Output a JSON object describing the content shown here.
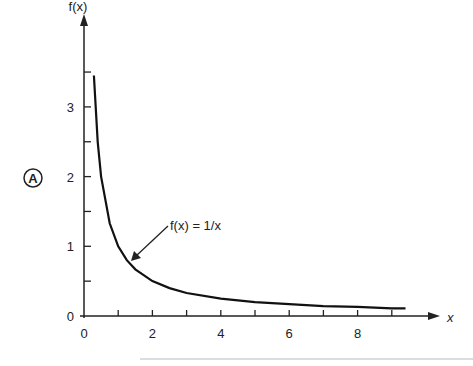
{
  "figure": {
    "panel_label": "A"
  },
  "chart_data": {
    "type": "line",
    "title": "",
    "xlabel": "x",
    "ylabel": "f(x)",
    "annotation": "f(x) = 1/x",
    "xlim": [
      0,
      9.5
    ],
    "ylim": [
      0,
      3.5
    ],
    "x_ticks": [
      0,
      2,
      4,
      6,
      8
    ],
    "y_ticks": [
      0,
      1,
      2,
      3
    ],
    "grid": false,
    "series": [
      {
        "name": "f(x) = 1/x",
        "x": [
          0.29,
          0.4,
          0.5,
          0.75,
          1,
          1.25,
          1.5,
          2,
          2.5,
          3,
          4,
          5,
          6,
          7,
          8,
          9,
          9.4
        ],
        "values": [
          3.45,
          2.5,
          2.0,
          1.33,
          1.0,
          0.8,
          0.67,
          0.5,
          0.4,
          0.33,
          0.25,
          0.2,
          0.17,
          0.14,
          0.13,
          0.11,
          0.11
        ]
      }
    ]
  }
}
